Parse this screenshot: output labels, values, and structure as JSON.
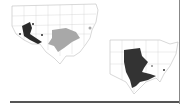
{
  "figure": {
    "maps": [
      {
        "id": "west",
        "description": "United States map with shaded regions",
        "regions": [
          {
            "name": "southwest-dark-region",
            "shade": "#2a2a2a"
          },
          {
            "name": "south-central-light-region",
            "shade": "#a8a8a8"
          }
        ]
      },
      {
        "id": "east",
        "description": "Eastern United States map with shaded region",
        "regions": [
          {
            "name": "central-east-dark-region",
            "shade": "#333333"
          }
        ]
      }
    ],
    "colors": {
      "outline": "#bdbdbd",
      "dark": "#2a2a2a",
      "light": "#a8a8a8",
      "background": "#ffffff"
    }
  }
}
